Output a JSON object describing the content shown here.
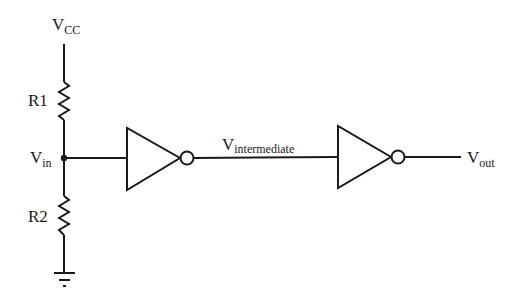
{
  "diagram": {
    "type": "circuit-schematic",
    "colors": {
      "stroke": "#1a1a1a",
      "background": "#ffffff"
    },
    "labels": {
      "vcc": {
        "main": "V",
        "sub": "CC"
      },
      "r1": "R1",
      "r2": "R2",
      "vin": {
        "main": "V",
        "sub": "in"
      },
      "vintermediate": {
        "main": "V",
        "sub": "intermediate"
      },
      "vout": {
        "main": "V",
        "sub": "out"
      }
    },
    "components": [
      {
        "id": "R1",
        "kind": "resistor"
      },
      {
        "id": "R2",
        "kind": "resistor"
      },
      {
        "id": "INV1",
        "kind": "inverter"
      },
      {
        "id": "INV2",
        "kind": "inverter"
      },
      {
        "id": "GND",
        "kind": "ground"
      }
    ],
    "connections": [
      [
        "VCC",
        "R1"
      ],
      [
        "R1",
        "Vin"
      ],
      [
        "Vin",
        "R2"
      ],
      [
        "R2",
        "GND"
      ],
      [
        "Vin",
        "INV1.in"
      ],
      [
        "INV1.out",
        "INV2.in"
      ],
      [
        "INV2.out",
        "Vout"
      ]
    ]
  }
}
